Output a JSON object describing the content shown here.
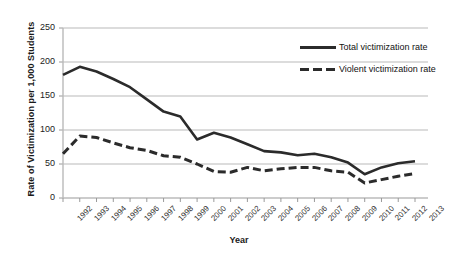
{
  "chart_data": {
    "type": "line",
    "title": "",
    "xlabel": "Year",
    "ylabel": "Rate of Victimization per 1,000 Students",
    "x": [
      1992,
      1993,
      1994,
      1995,
      1996,
      1997,
      1998,
      1999,
      2000,
      2001,
      2002,
      2003,
      2004,
      2005,
      2006,
      2007,
      2008,
      2009,
      2010,
      2011,
      2012,
      2013
    ],
    "categories": [
      "1992",
      "1993",
      "1994",
      "1995",
      "1996",
      "1997",
      "1998",
      "1999",
      "2000",
      "2001",
      "2002",
      "2003",
      "2004",
      "2005",
      "2006",
      "2007",
      "2008",
      "2009",
      "2010",
      "2011",
      "2012",
      "2013"
    ],
    "ylim": [
      0,
      250
    ],
    "yticks": [
      0,
      50,
      100,
      150,
      200,
      250
    ],
    "grid": true,
    "legend_position": "top-right",
    "series": [
      {
        "name": "Total victimization rate",
        "style": "solid",
        "color": "#2b2b2b",
        "values": [
          181,
          193,
          186,
          175,
          163,
          145,
          127,
          120,
          86,
          96,
          89,
          79,
          69,
          67,
          63,
          65,
          60,
          52,
          35,
          45,
          51,
          54
        ]
      },
      {
        "name": "Violent victimization rate",
        "style": "dashed",
        "color": "#2b2b2b",
        "values": [
          65,
          91,
          89,
          81,
          74,
          70,
          62,
          60,
          50,
          39,
          38,
          45,
          40,
          43,
          45,
          45,
          40,
          38,
          22,
          27,
          32,
          36
        ]
      }
    ]
  },
  "legend": {
    "items": [
      {
        "label": "Total victimization rate"
      },
      {
        "label": "Violent victimization rate"
      }
    ]
  },
  "axes": {
    "y_title": "Rate of Victimization per 1,000 Students",
    "x_title": "Year"
  }
}
